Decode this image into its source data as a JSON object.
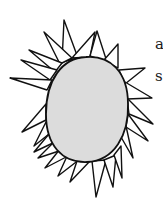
{
  "illustration": {
    "subject": "egg-shaped cell with spiky projections",
    "colors": {
      "fill": "#dcdcdc",
      "stroke": "#111111",
      "background": "#ffffff"
    }
  },
  "side_text": {
    "line1": "a",
    "line2": "s"
  }
}
